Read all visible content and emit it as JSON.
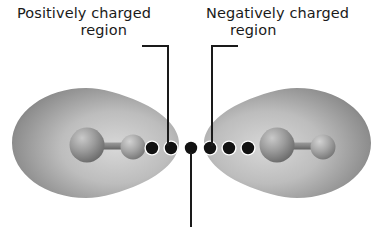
{
  "figure": {
    "type": "molecular-interaction-diagram",
    "background_color": "#ffffff",
    "ink_color": "#1a1a1a"
  },
  "labels": {
    "positive": {
      "line1": "Positively charged",
      "line2": "region"
    },
    "negative": {
      "line1": "Negatively charged",
      "line2": "region"
    }
  },
  "leaders": [
    {
      "name": "leader-positive",
      "from_label": "positive",
      "horizontal_from_x": 142,
      "horizontal_to_x": 168,
      "horizontal_y": 46,
      "vertical_to_y": 146,
      "color": "#1a1a1a"
    },
    {
      "name": "leader-negative",
      "from_label": "negative",
      "horizontal_from_x": 238,
      "horizontal_to_x": 212,
      "horizontal_y": 46,
      "vertical_to_y": 146,
      "color": "#1a1a1a"
    },
    {
      "name": "leader-center",
      "from_label": "",
      "vertical_x": 191,
      "vertical_from_y": 152,
      "vertical_to_y": 227,
      "color": "#1a1a1a"
    }
  ],
  "molecules": [
    {
      "name": "molecule-left",
      "cloud": {
        "center_x": 95,
        "center_y": 142,
        "radius_x": 84,
        "radius_y": 56,
        "point_direction": "right",
        "fill_light": "#cfcfcf",
        "fill_dark": "#6e6e6e",
        "highlight_x": 62,
        "highlight_y": 54
      },
      "atoms": [
        {
          "name": "atom-large",
          "cx": 87,
          "cy": 145,
          "r": 17,
          "fill_light": "#b9b9b9",
          "fill_dark": "#6a6a6a"
        },
        {
          "name": "atom-small",
          "cx": 133,
          "cy": 147,
          "r": 12,
          "fill_light": "#c4c4c4",
          "fill_dark": "#767676"
        }
      ],
      "bond": {
        "x1": 87,
        "y1": 146,
        "x2": 133,
        "y2": 147,
        "width": 7,
        "fill": "#8a8a8a"
      }
    },
    {
      "name": "molecule-right",
      "cloud": {
        "center_x": 288,
        "center_y": 142,
        "radius_x": 84,
        "radius_y": 56,
        "point_direction": "left",
        "fill_light": "#cfcfcf",
        "fill_dark": "#6e6e6e",
        "highlight_x": 62,
        "highlight_y": 54
      },
      "atoms": [
        {
          "name": "atom-large",
          "cx": 277,
          "cy": 145,
          "r": 17,
          "fill_light": "#b9b9b9",
          "fill_dark": "#6a6a6a"
        },
        {
          "name": "atom-small",
          "cx": 323,
          "cy": 147,
          "r": 12,
          "fill_light": "#c4c4c4",
          "fill_dark": "#767676"
        }
      ],
      "bond": {
        "x1": 277,
        "y1": 146,
        "x2": 323,
        "y2": 147,
        "width": 7,
        "fill": "#8a8a8a"
      }
    }
  ],
  "charge_dots": {
    "name": "charge-dot-chain",
    "count": 6,
    "radius": 6.2,
    "halo_radius": 7.6,
    "fill": "#121212",
    "halo_fill": "#ffffff",
    "y": 148,
    "x_positions": [
      152,
      171,
      191,
      210,
      229,
      248
    ]
  }
}
